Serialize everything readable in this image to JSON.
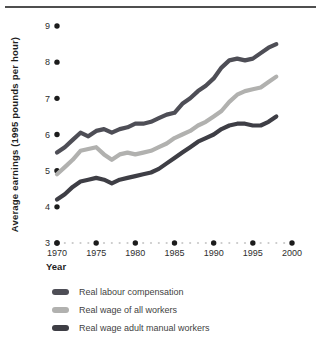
{
  "figure": {
    "ylabel": "Average earnings (1995 pounds per hour)",
    "xlabel": "Year"
  },
  "colors": {
    "rule": "#4f4f4f",
    "axis_dot": "#1c1c1c",
    "minor_dot": "#c9c9c9",
    "tick_text": "#2e2e2e"
  },
  "chart_data": {
    "type": "line",
    "title": "",
    "xlabel": "Year",
    "ylabel": "Average earnings (1995 pounds per hour)",
    "xlim": [
      1970,
      2000
    ],
    "ylim": [
      3,
      9
    ],
    "x_ticks": [
      1970,
      1975,
      1980,
      1985,
      1990,
      1995,
      2000
    ],
    "y_ticks": [
      3,
      4,
      5,
      6,
      7,
      8,
      9
    ],
    "grid": "off",
    "axis_style": "dotted baseline with black tick dots, no solid axis lines",
    "legend_position": "below-left",
    "x": [
      1970,
      1971,
      1972,
      1973,
      1974,
      1975,
      1976,
      1977,
      1978,
      1979,
      1980,
      1981,
      1982,
      1983,
      1984,
      1985,
      1986,
      1987,
      1988,
      1989,
      1990,
      1991,
      1992,
      1993,
      1994,
      1995,
      1996,
      1997,
      1998
    ],
    "series": [
      {
        "name": "Real labour compensation",
        "color": "#4e4e56",
        "values": [
          5.5,
          5.65,
          5.85,
          6.05,
          5.95,
          6.1,
          6.15,
          6.05,
          6.15,
          6.2,
          6.3,
          6.3,
          6.35,
          6.45,
          6.55,
          6.6,
          6.85,
          7.0,
          7.2,
          7.35,
          7.55,
          7.85,
          8.05,
          8.1,
          8.05,
          8.1,
          8.25,
          8.4,
          8.5
        ]
      },
      {
        "name": "Real wage of all workers",
        "color": "#b1b1af",
        "values": [
          4.9,
          5.1,
          5.3,
          5.55,
          5.6,
          5.65,
          5.45,
          5.3,
          5.45,
          5.5,
          5.45,
          5.5,
          5.55,
          5.65,
          5.75,
          5.9,
          6.0,
          6.1,
          6.25,
          6.35,
          6.5,
          6.65,
          6.9,
          7.1,
          7.2,
          7.25,
          7.3,
          7.45,
          7.6
        ]
      },
      {
        "name": "Real wage adult manual workers",
        "color": "#3e3e45",
        "values": [
          4.2,
          4.35,
          4.55,
          4.7,
          4.75,
          4.8,
          4.75,
          4.65,
          4.75,
          4.8,
          4.85,
          4.9,
          4.95,
          5.05,
          5.2,
          5.35,
          5.5,
          5.65,
          5.8,
          5.9,
          6.0,
          6.15,
          6.25,
          6.3,
          6.3,
          6.25,
          6.25,
          6.35,
          6.5
        ]
      }
    ]
  }
}
